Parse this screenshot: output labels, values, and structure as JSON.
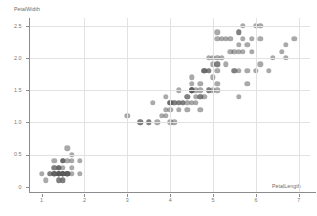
{
  "chart_data": {
    "type": "scatter",
    "title": "",
    "xlabel": "PetalLength",
    "ylabel": "PetalWidth",
    "xlim": [
      0.72,
      7.25
    ],
    "ylim": [
      -0.08,
      2.62
    ],
    "xticks": [
      1,
      2,
      3,
      4,
      5,
      6,
      7
    ],
    "xtick_labels": [
      "1",
      "2",
      "3",
      "4",
      "5",
      "6",
      "7"
    ],
    "yticks": [
      0,
      0.5,
      1.0,
      1.5,
      2.0,
      2.5
    ],
    "ytick_labels": [
      "0",
      "0.5",
      "1.0",
      "1.5",
      "2.0",
      "2.5"
    ],
    "grid": true,
    "grid_color": "#e2e2e2",
    "axis_color": "#8c8c8c",
    "marker_color": "#5a5a5a",
    "marker_opacity": 0.52,
    "legend": null,
    "series": [
      {
        "name": "iris",
        "points": [
          [
            1.4,
            0.2
          ],
          [
            1.4,
            0.2
          ],
          [
            1.3,
            0.2
          ],
          [
            1.5,
            0.2
          ],
          [
            1.4,
            0.2
          ],
          [
            1.7,
            0.4
          ],
          [
            1.4,
            0.3
          ],
          [
            1.5,
            0.2
          ],
          [
            1.4,
            0.2
          ],
          [
            1.5,
            0.1
          ],
          [
            1.5,
            0.2
          ],
          [
            1.6,
            0.2
          ],
          [
            1.4,
            0.1
          ],
          [
            1.1,
            0.1
          ],
          [
            1.2,
            0.2
          ],
          [
            1.5,
            0.4
          ],
          [
            1.3,
            0.4
          ],
          [
            1.4,
            0.3
          ],
          [
            1.7,
            0.3
          ],
          [
            1.5,
            0.3
          ],
          [
            1.7,
            0.2
          ],
          [
            1.5,
            0.4
          ],
          [
            1.0,
            0.2
          ],
          [
            1.7,
            0.5
          ],
          [
            1.9,
            0.2
          ],
          [
            1.6,
            0.2
          ],
          [
            1.6,
            0.4
          ],
          [
            1.5,
            0.2
          ],
          [
            1.4,
            0.2
          ],
          [
            1.6,
            0.2
          ],
          [
            1.6,
            0.2
          ],
          [
            1.5,
            0.4
          ],
          [
            1.5,
            0.1
          ],
          [
            1.4,
            0.2
          ],
          [
            1.5,
            0.2
          ],
          [
            1.2,
            0.2
          ],
          [
            1.3,
            0.2
          ],
          [
            1.4,
            0.1
          ],
          [
            1.3,
            0.2
          ],
          [
            1.5,
            0.2
          ],
          [
            1.3,
            0.3
          ],
          [
            1.3,
            0.3
          ],
          [
            1.3,
            0.2
          ],
          [
            1.6,
            0.6
          ],
          [
            1.9,
            0.4
          ],
          [
            1.4,
            0.3
          ],
          [
            1.6,
            0.2
          ],
          [
            1.4,
            0.2
          ],
          [
            1.5,
            0.2
          ],
          [
            1.4,
            0.2
          ],
          [
            4.7,
            1.4
          ],
          [
            4.5,
            1.5
          ],
          [
            4.9,
            1.5
          ],
          [
            4.0,
            1.3
          ],
          [
            4.6,
            1.5
          ],
          [
            4.5,
            1.3
          ],
          [
            4.7,
            1.6
          ],
          [
            3.3,
            1.0
          ],
          [
            4.6,
            1.3
          ],
          [
            3.9,
            1.4
          ],
          [
            3.5,
            1.0
          ],
          [
            4.2,
            1.5
          ],
          [
            4.0,
            1.0
          ],
          [
            4.7,
            1.4
          ],
          [
            3.6,
            1.3
          ],
          [
            4.4,
            1.4
          ],
          [
            4.5,
            1.5
          ],
          [
            4.1,
            1.0
          ],
          [
            4.5,
            1.5
          ],
          [
            3.9,
            1.1
          ],
          [
            4.8,
            1.8
          ],
          [
            4.0,
            1.3
          ],
          [
            4.9,
            1.5
          ],
          [
            4.7,
            1.2
          ],
          [
            4.3,
            1.3
          ],
          [
            4.4,
            1.4
          ],
          [
            4.8,
            1.4
          ],
          [
            5.0,
            1.7
          ],
          [
            4.5,
            1.5
          ],
          [
            3.5,
            1.0
          ],
          [
            3.8,
            1.1
          ],
          [
            3.7,
            1.0
          ],
          [
            3.9,
            1.2
          ],
          [
            5.1,
            1.6
          ],
          [
            4.5,
            1.5
          ],
          [
            4.5,
            1.6
          ],
          [
            4.7,
            1.5
          ],
          [
            4.4,
            1.3
          ],
          [
            4.1,
            1.3
          ],
          [
            4.0,
            1.3
          ],
          [
            4.4,
            1.2
          ],
          [
            4.6,
            1.4
          ],
          [
            4.0,
            1.2
          ],
          [
            3.3,
            1.0
          ],
          [
            4.2,
            1.3
          ],
          [
            4.2,
            1.2
          ],
          [
            4.2,
            1.3
          ],
          [
            4.3,
            1.3
          ],
          [
            3.0,
            1.1
          ],
          [
            4.1,
            1.3
          ],
          [
            6.0,
            2.5
          ],
          [
            5.1,
            1.9
          ],
          [
            5.9,
            2.1
          ],
          [
            5.6,
            1.8
          ],
          [
            5.8,
            2.2
          ],
          [
            6.6,
            2.1
          ],
          [
            4.5,
            1.7
          ],
          [
            6.3,
            1.8
          ],
          [
            5.8,
            1.8
          ],
          [
            6.1,
            2.5
          ],
          [
            5.1,
            2.0
          ],
          [
            5.3,
            1.9
          ],
          [
            5.5,
            2.1
          ],
          [
            5.0,
            2.0
          ],
          [
            5.1,
            2.4
          ],
          [
            5.3,
            2.3
          ],
          [
            5.5,
            1.8
          ],
          [
            6.7,
            2.2
          ],
          [
            6.9,
            2.3
          ],
          [
            5.0,
            1.5
          ],
          [
            5.7,
            2.3
          ],
          [
            4.9,
            2.0
          ],
          [
            6.7,
            2.0
          ],
          [
            4.9,
            1.8
          ],
          [
            5.7,
            2.1
          ],
          [
            6.0,
            1.8
          ],
          [
            4.8,
            1.8
          ],
          [
            4.9,
            1.8
          ],
          [
            5.6,
            2.1
          ],
          [
            5.8,
            1.6
          ],
          [
            6.1,
            1.9
          ],
          [
            6.4,
            2.0
          ],
          [
            5.6,
            2.2
          ],
          [
            5.1,
            1.5
          ],
          [
            5.6,
            1.4
          ],
          [
            6.1,
            2.3
          ],
          [
            5.6,
            2.4
          ],
          [
            5.5,
            1.8
          ],
          [
            4.8,
            1.8
          ],
          [
            5.4,
            2.1
          ],
          [
            5.6,
            2.4
          ],
          [
            5.1,
            2.3
          ],
          [
            5.1,
            1.9
          ],
          [
            5.9,
            2.3
          ],
          [
            5.7,
            2.5
          ],
          [
            5.2,
            2.3
          ],
          [
            5.0,
            1.9
          ],
          [
            5.2,
            2.0
          ],
          [
            5.4,
            2.3
          ],
          [
            5.1,
            1.8
          ]
        ]
      }
    ]
  }
}
